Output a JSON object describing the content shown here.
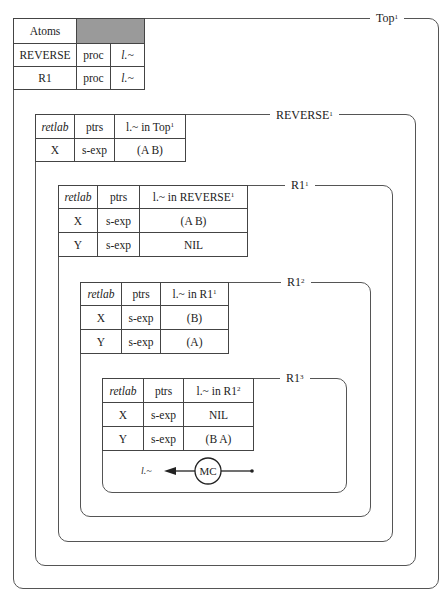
{
  "frames": [
    {
      "id": "top",
      "title": "Top",
      "superscript": "1"
    },
    {
      "id": "reverse",
      "title": "REVERSE",
      "superscript": "1"
    },
    {
      "id": "r1-1",
      "title": "R1",
      "superscript": "1"
    },
    {
      "id": "r1-2",
      "title": "R1",
      "superscript": "2"
    },
    {
      "id": "r1-3",
      "title": "R1",
      "superscript": "3"
    }
  ],
  "atoms_table": {
    "header": "Atoms",
    "rows": [
      [
        "REVERSE",
        "proc",
        "l.~"
      ],
      [
        "R1",
        "proc",
        "l.~"
      ]
    ]
  },
  "tables": [
    {
      "headers": [
        "retlab",
        "ptrs",
        "l.~ in Top"
      ],
      "header_sup": "1",
      "rows": [
        [
          "X",
          "s-exp",
          "(A B)"
        ]
      ]
    },
    {
      "headers": [
        "retlab",
        "ptrs",
        "l.~ in REVERSE"
      ],
      "header_sup": "1",
      "rows": [
        [
          "X",
          "s-exp",
          "(A B)"
        ],
        [
          "Y",
          "s-exp",
          "NIL"
        ]
      ]
    },
    {
      "headers": [
        "retlab",
        "ptrs",
        "l.~ in R1"
      ],
      "header_sup": "1",
      "rows": [
        [
          "X",
          "s-exp",
          "(B)"
        ],
        [
          "Y",
          "s-exp",
          "(A)"
        ]
      ]
    },
    {
      "headers": [
        "retlab",
        "ptrs",
        "l.~ in R1"
      ],
      "header_sup": "2",
      "rows": [
        [
          "X",
          "s-exp",
          "NIL"
        ],
        [
          "Y",
          "s-exp",
          "(B A)"
        ]
      ]
    }
  ],
  "mc": {
    "circle_label": "MC",
    "arrow_label": "l.~"
  }
}
